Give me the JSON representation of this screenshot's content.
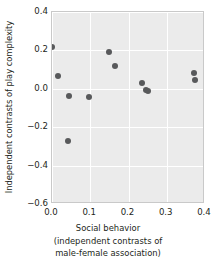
{
  "chart_data": {
    "type": "scatter",
    "title": "",
    "xlabel": "Social behavior (independent contrasts of male-female association)",
    "xlabel_lines": [
      "Social behavior",
      "(independent contrasts of",
      "male-female association)"
    ],
    "ylabel": "Independent contrasts of play complexity",
    "xlim": [
      0.0,
      0.4
    ],
    "ylim": [
      -0.6,
      0.4
    ],
    "xticks": [
      "0.0",
      "0.1",
      "0.2",
      "0.3",
      "0.4"
    ],
    "xtick_values": [
      0.0,
      0.1,
      0.2,
      0.3,
      0.4
    ],
    "yticks": [
      "0.4",
      "0.2",
      "0.0",
      "-0.2",
      "-0.4",
      "-0.6"
    ],
    "ytick_values": [
      0.4,
      0.2,
      0.0,
      -0.2,
      -0.4,
      -0.6
    ],
    "grid": true,
    "grid_color": "#ffffff",
    "plot_background": "#ebebeb",
    "point_color": "#58595b",
    "legend": null,
    "points": [
      {
        "x": 0.0,
        "y": 0.22
      },
      {
        "x": 0.016,
        "y": 0.065
      },
      {
        "x": 0.042,
        "y": -0.27
      },
      {
        "x": 0.044,
        "y": -0.035
      },
      {
        "x": 0.097,
        "y": -0.045
      },
      {
        "x": 0.15,
        "y": 0.19
      },
      {
        "x": 0.165,
        "y": 0.12
      },
      {
        "x": 0.236,
        "y": 0.03
      },
      {
        "x": 0.246,
        "y": -0.005
      },
      {
        "x": 0.251,
        "y": -0.012
      },
      {
        "x": 0.372,
        "y": 0.08
      },
      {
        "x": 0.375,
        "y": 0.045
      }
    ]
  }
}
